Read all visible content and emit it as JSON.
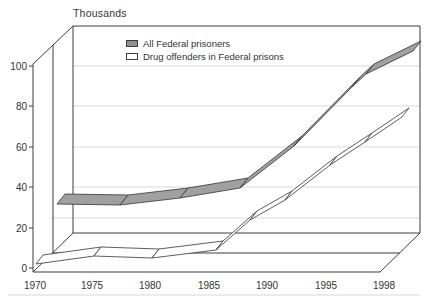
{
  "page": {
    "background": "#ffffff"
  },
  "header": {
    "unit_label": "Thousands"
  },
  "legend": {
    "swatch_border": "#3d3d3d",
    "items": [
      {
        "label": "All Federal prisoners",
        "swatch_fill": "#8f8f8f"
      },
      {
        "label": "Drug offenders in Federal prisons",
        "swatch_fill": "#ffffff"
      }
    ]
  },
  "chart_data": {
    "type": "line",
    "style": "3d-ribbon",
    "title": "",
    "ylabel": "Thousands",
    "xlabel": "",
    "ylim": [
      0,
      100
    ],
    "grid": true,
    "legend_position": "top-center",
    "x": [
      1970,
      1975,
      1980,
      1985,
      1990,
      1995,
      1998
    ],
    "x_tick_labels": [
      "1970",
      "1975",
      "1980",
      "1985",
      "1990",
      "1995",
      "1998"
    ],
    "y_tick_labels": [
      "0",
      "20",
      "40",
      "60",
      "80",
      "100"
    ],
    "series": [
      {
        "name": "All Federal prisoners",
        "values": [
          32,
          31,
          35,
          40,
          61,
          90,
          108
        ]
      },
      {
        "name": "Drug offenders in Federal prisons",
        "values": [
          3,
          6,
          5,
          9,
          29,
          51,
          68
        ]
      }
    ],
    "render": {
      "frame_color": "#3d3d3d",
      "grid_color": "#dadada",
      "tick_color": "#3d3d3d",
      "frame_lines": [
        [
          33,
          64,
          33,
          272
        ],
        [
          33,
          272,
          380,
          272
        ],
        [
          33,
          64,
          73,
          26
        ],
        [
          53,
          45,
          53,
          253
        ],
        [
          33,
          272,
          73,
          233
        ],
        [
          73,
          26,
          73,
          233
        ],
        [
          73,
          26,
          420,
          26
        ],
        [
          420,
          26,
          420,
          233
        ],
        [
          73,
          233,
          420,
          233
        ],
        [
          380,
          272,
          420,
          233
        ],
        [
          53,
          253,
          400,
          253
        ]
      ],
      "grid_segments": [
        [
          73,
          66,
          420,
          66
        ],
        [
          73,
          106,
          420,
          106
        ],
        [
          73,
          147,
          420,
          147
        ],
        [
          73,
          187,
          420,
          187
        ],
        [
          50,
          218,
          420,
          218
        ]
      ],
      "y_ticks": [
        {
          "label": "100",
          "y": 66
        },
        {
          "label": "80",
          "y": 106
        },
        {
          "label": "60",
          "y": 147
        },
        {
          "label": "40",
          "y": 187
        },
        {
          "label": "20",
          "y": 228
        },
        {
          "label": "0",
          "y": 268
        }
      ],
      "x_ticks": [
        {
          "label": "1970",
          "x": 35
        },
        {
          "label": "1975",
          "x": 92
        },
        {
          "label": "1980",
          "x": 150
        },
        {
          "label": "1985",
          "x": 209
        },
        {
          "label": "1990",
          "x": 267
        },
        {
          "label": "1995",
          "x": 326
        },
        {
          "label": "1998",
          "x": 384
        }
      ],
      "tick_inner_x": 29,
      "tick_outer_x": 33,
      "y_label_x": 30,
      "x_label_y": 289,
      "ribbons": [
        {
          "name": "All Federal prisoners",
          "fill": "#a0a0a0",
          "stroke": "#333333",
          "extrude": [
            8,
            -10
          ],
          "points": [
            [
              57,
              204
            ],
            [
              120,
              205
            ],
            [
              180,
              198
            ],
            [
              240,
              188
            ],
            [
              294,
              146
            ],
            [
              352,
              87
            ],
            [
              366,
              74
            ],
            [
              413,
              51
            ]
          ]
        },
        {
          "name": "Drug offenders in Federal prisons",
          "fill": "#ffffff",
          "stroke": "#333333",
          "extrude": [
            7,
            -9
          ],
          "points": [
            [
              36,
              264
            ],
            [
              94,
              256
            ],
            [
              152,
              258
            ],
            [
              216,
              250
            ],
            [
              250,
              220
            ],
            [
              285,
              200
            ],
            [
              330,
              165
            ],
            [
              365,
              142
            ],
            [
              402,
              117
            ]
          ]
        }
      ],
      "baseline_rule": {
        "x1": 8,
        "y1": 295,
        "x2": 420,
        "y2": 295,
        "color": "#d8d8d8"
      }
    }
  }
}
